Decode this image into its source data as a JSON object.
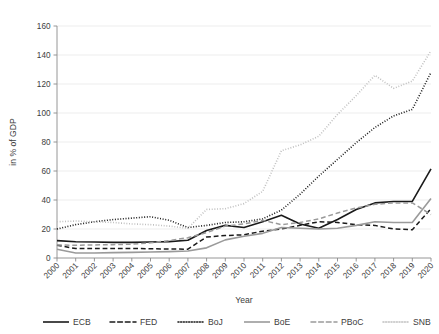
{
  "chart_data": {
    "type": "line",
    "title": "",
    "xlabel": "Year",
    "ylabel": "in % of GDP",
    "xlim": [
      2000,
      2020
    ],
    "ylim": [
      0,
      160
    ],
    "ytick_step": 20,
    "grid": true,
    "legend_position": "bottom",
    "x": [
      2000,
      2001,
      2002,
      2003,
      2004,
      2005,
      2006,
      2007,
      2008,
      2009,
      2010,
      2011,
      2012,
      2013,
      2014,
      2015,
      2016,
      2017,
      2018,
      2019,
      2020
    ],
    "xtick_labels": [
      "2000",
      "2001",
      "2002",
      "2003",
      "2004",
      "2005",
      "2006",
      "2007",
      "2008",
      "2009",
      "2010",
      "2011",
      "2012",
      "2013",
      "2014",
      "2015",
      "2016",
      "2017",
      "2018",
      "2019",
      "2020"
    ],
    "ytick_labels": [
      "0",
      "20",
      "40",
      "60",
      "80",
      "100",
      "120",
      "140",
      "160"
    ],
    "series": [
      {
        "name": "ECB",
        "style": "solid",
        "color": "#1a1a1a",
        "width": 1.6,
        "values": [
          12.0,
          11.2,
          11.0,
          10.8,
          10.8,
          11.0,
          11.3,
          12.2,
          19.0,
          22.5,
          21.0,
          25.0,
          29.5,
          23.5,
          20.5,
          26.5,
          33.5,
          38.0,
          39.0,
          39.0,
          61.5
        ]
      },
      {
        "name": "FED",
        "style": "dashed",
        "color": "#1a1a1a",
        "width": 1.5,
        "values": [
          8.8,
          6.5,
          6.5,
          6.5,
          6.6,
          6.4,
          6.2,
          6.1,
          14.5,
          15.5,
          16.0,
          18.5,
          20.0,
          22.5,
          25.0,
          24.5,
          23.0,
          22.5,
          20.0,
          19.5,
          34.0
        ]
      },
      {
        "name": "BoJ",
        "style": "dotted",
        "color": "#1a1a1a",
        "width": 1.6,
        "values": [
          20.0,
          23.0,
          25.0,
          26.5,
          27.5,
          28.5,
          26.0,
          21.0,
          22.5,
          24.5,
          25.0,
          27.0,
          33.0,
          44.0,
          56.5,
          68.0,
          79.5,
          90.0,
          98.0,
          102.5,
          128.0
        ]
      },
      {
        "name": "BoE",
        "style": "solid",
        "color": "#9a9a9a",
        "width": 1.6,
        "values": [
          6.0,
          3.5,
          3.5,
          3.7,
          3.9,
          4.1,
          4.4,
          4.8,
          7.0,
          12.5,
          15.0,
          17.0,
          21.0,
          20.5,
          20.0,
          20.5,
          22.5,
          25.0,
          24.5,
          24.5,
          41.0
        ]
      },
      {
        "name": "PBoC",
        "style": "dashed",
        "color": "#9a9a9a",
        "width": 1.5,
        "values": [
          9.0,
          8.8,
          9.0,
          9.2,
          9.5,
          10.5,
          12.0,
          14.0,
          17.5,
          22.0,
          23.5,
          26.0,
          23.0,
          24.5,
          27.0,
          31.0,
          34.5,
          37.0,
          38.0,
          38.0,
          30.0
        ]
      },
      {
        "name": "SNB",
        "style": "dotted",
        "color": "#c0c0c0",
        "width": 1.6,
        "values": [
          25.0,
          25.5,
          25.0,
          24.5,
          23.5,
          23.0,
          22.0,
          20.5,
          33.5,
          34.0,
          37.5,
          46.0,
          74.0,
          78.0,
          84.0,
          99.0,
          112.0,
          126.0,
          117.0,
          122.0,
          143.0
        ]
      }
    ]
  },
  "legend": {
    "items": [
      {
        "label": "ECB"
      },
      {
        "label": "FED"
      },
      {
        "label": "BoJ"
      },
      {
        "label": "BoE"
      },
      {
        "label": "PBoC"
      },
      {
        "label": "SNB"
      }
    ]
  }
}
